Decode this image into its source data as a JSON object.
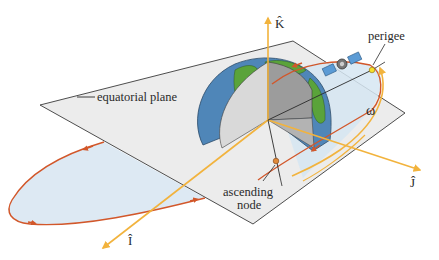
{
  "figure": {
    "labels": {
      "equatorial_plane": "equatorial plane",
      "perigee": "perigee",
      "ascending_node_line1": "ascending",
      "ascending_node_line2": "node",
      "omega": "ω",
      "axis_K": "K̂",
      "axis_I": "Î",
      "axis_J": "Ĵ"
    },
    "colors": {
      "plane_fill": "#ececec",
      "plane_edge": "#3a3a3a",
      "orbit_fill": "#dde9f3",
      "orbit_line": "#d2572a",
      "axis": "#f2b33d",
      "ocean": "#4f86b8",
      "land": "#5aa33a",
      "cut_face_light": "#d9d9d9",
      "cut_face_dark": "#9c9c9c",
      "perigee_dot": "#f5e02a",
      "node_dot": "#e08a3a"
    }
  }
}
